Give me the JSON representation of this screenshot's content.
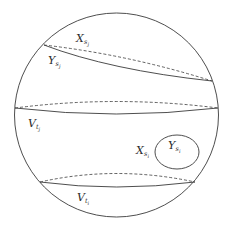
{
  "diagram": {
    "type": "sphere-decomposition",
    "colors": {
      "background": "#ffffff",
      "stroke": "#3a3a3a",
      "text": "#2a2a2a"
    },
    "labels": {
      "x_sj": {
        "base": "X",
        "sub": "s",
        "subsub": "j"
      },
      "y_sj": {
        "base": "Y",
        "sub": "s",
        "subsub": "j"
      },
      "v_tj": {
        "base": "V",
        "sub": "t",
        "subsub": "j"
      },
      "x_si": {
        "base": "X",
        "sub": "s",
        "subsub": "i"
      },
      "y_si": {
        "base": "Y",
        "sub": "s",
        "subsub": "i"
      },
      "v_ti": {
        "base": "V",
        "sub": "t",
        "subsub": "i"
      }
    }
  }
}
